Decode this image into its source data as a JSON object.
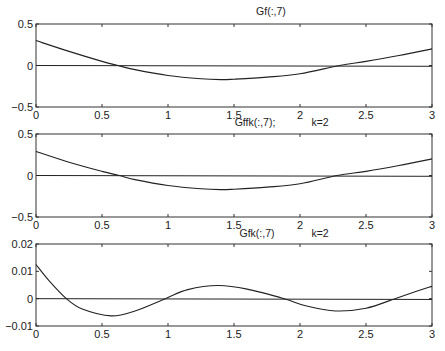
{
  "chart_data": [
    {
      "type": "line",
      "title": "Gf(:,7)",
      "title_extra": "",
      "xlabel": "",
      "ylabel": "",
      "xlim": [
        0,
        3
      ],
      "ylim": [
        -0.5,
        0.5
      ],
      "xticks": [
        0,
        0.5,
        1,
        1.5,
        2,
        2.5,
        3
      ],
      "xtick_labels": [
        "0",
        "0.5",
        "1",
        "1.5",
        "2",
        "2.5",
        "3"
      ],
      "yticks": [
        -0.5,
        0,
        0.5
      ],
      "ytick_labels": [
        "-0.5",
        "0",
        "0.5"
      ],
      "grid": false,
      "zero_line": true,
      "series": [
        {
          "name": "Gf(:,7)",
          "x": [
            0,
            0.25,
            0.5,
            0.62,
            0.75,
            1.0,
            1.25,
            1.4,
            1.5,
            1.75,
            2.0,
            2.3,
            2.5,
            2.75,
            3.0
          ],
          "y": [
            0.3,
            0.17,
            0.05,
            0.0,
            -0.05,
            -0.12,
            -0.16,
            -0.17,
            -0.165,
            -0.14,
            -0.1,
            0.0,
            0.05,
            0.12,
            0.2
          ]
        }
      ]
    },
    {
      "type": "line",
      "title": "Gffk(:,7);",
      "title_extra": "k=2",
      "xlabel": "",
      "ylabel": "",
      "xlim": [
        0,
        3
      ],
      "ylim": [
        -0.5,
        0.5
      ],
      "xticks": [
        0,
        0.5,
        1,
        1.5,
        2,
        2.5,
        3
      ],
      "xtick_labels": [
        "0",
        "0.5",
        "1",
        "1.5",
        "2",
        "2.5",
        "3"
      ],
      "yticks": [
        -0.5,
        0,
        0.5
      ],
      "ytick_labels": [
        "-0.5",
        "0",
        "0.5"
      ],
      "grid": false,
      "zero_line": true,
      "series": [
        {
          "name": "Gffk(:,7)",
          "x": [
            0,
            0.25,
            0.5,
            0.63,
            0.75,
            1.0,
            1.25,
            1.4,
            1.5,
            1.75,
            2.0,
            2.28,
            2.5,
            2.75,
            3.0
          ],
          "y": [
            0.29,
            0.16,
            0.05,
            0.0,
            -0.05,
            -0.12,
            -0.16,
            -0.17,
            -0.165,
            -0.14,
            -0.1,
            0.0,
            0.05,
            0.12,
            0.2
          ]
        }
      ]
    },
    {
      "type": "line",
      "title": "Gfk(:,7)",
      "title_extra": "k=2",
      "xlabel": "",
      "ylabel": "",
      "xlim": [
        0,
        3
      ],
      "ylim": [
        -0.01,
        0.02
      ],
      "xticks": [
        0,
        0.5,
        1,
        1.5,
        2,
        2.5,
        3
      ],
      "xtick_labels": [
        "0",
        "0.5",
        "1",
        "1.5",
        "2",
        "2.5",
        "3"
      ],
      "yticks": [
        -0.01,
        0,
        0.01,
        0.02
      ],
      "ytick_labels": [
        "-0.01",
        "0",
        "0.01",
        "0.02"
      ],
      "grid": false,
      "zero_line": true,
      "series": [
        {
          "name": "Gfk(:,7)",
          "x": [
            0,
            0.1,
            0.23,
            0.35,
            0.57,
            0.75,
            0.98,
            1.15,
            1.38,
            1.6,
            1.88,
            2.05,
            2.27,
            2.5,
            2.72,
            2.85,
            3.0
          ],
          "y": [
            0.0125,
            0.0065,
            0.0,
            -0.0038,
            -0.0063,
            -0.0045,
            0.0,
            0.0033,
            0.0048,
            0.0035,
            0.0,
            -0.0027,
            -0.0045,
            -0.0035,
            0.0,
            0.0022,
            0.0045
          ]
        }
      ]
    }
  ],
  "layout": {
    "axes_px": [
      {
        "left": 36,
        "right": 432,
        "top": 24,
        "bottom": 107
      },
      {
        "left": 36,
        "right": 432,
        "top": 134,
        "bottom": 217
      },
      {
        "left": 36,
        "right": 432,
        "top": 244,
        "bottom": 326
      }
    ],
    "title_pos": [
      {
        "x": 271,
        "y": 15,
        "extra_x": 0
      },
      {
        "x": 255,
        "y": 126,
        "extra_x": 320
      },
      {
        "x": 257,
        "y": 237,
        "extra_x": 320
      }
    ],
    "line_color": "#222222",
    "axis_color": "#333333"
  }
}
